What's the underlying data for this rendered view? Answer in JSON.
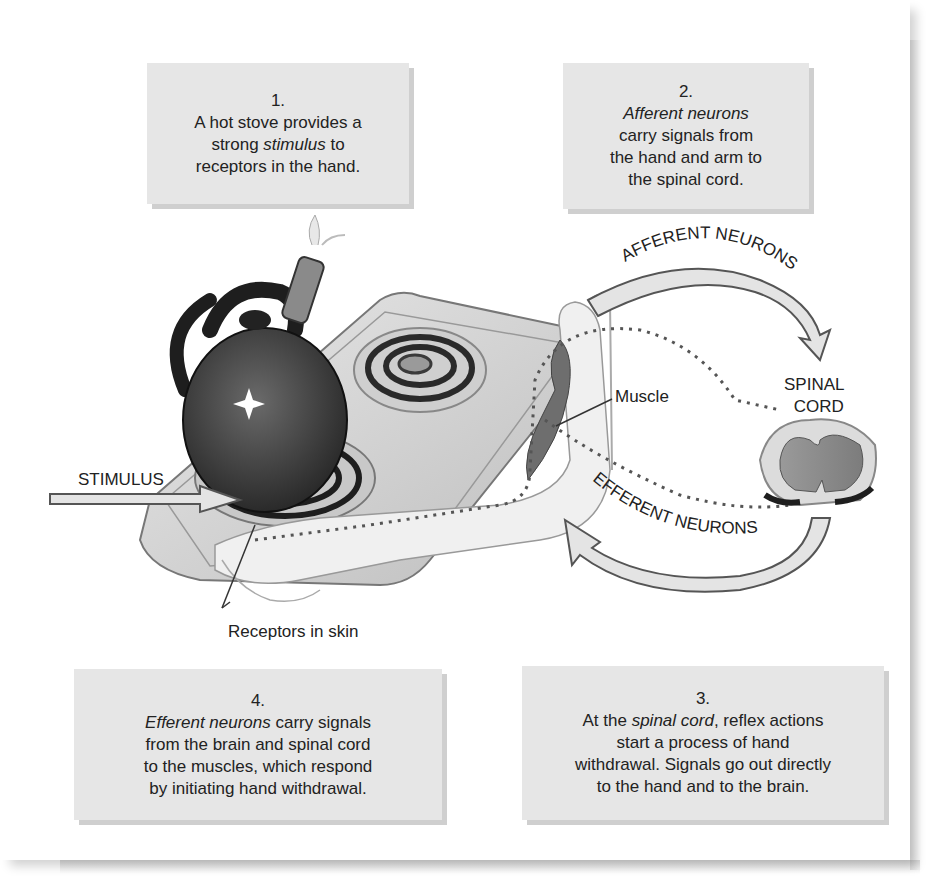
{
  "steps": [
    {
      "number": "1.",
      "pre": "A hot stove provides a strong ",
      "em": "stimulus",
      "post": " to receptors in the hand.",
      "lines": [
        "A hot stove provides a",
        "strong ",
        "stimulus",
        " to",
        "receptors in the hand."
      ]
    },
    {
      "number": "2.",
      "em": "Afferent neurons",
      "post": "carry signals from the hand and arm to the spinal cord.",
      "lines": [
        "Afferent neurons",
        "carry signals from",
        "the hand and arm to",
        "the spinal cord."
      ]
    },
    {
      "number": "3.",
      "pre": "At the ",
      "em": "spinal cord",
      "post": ", reflex actions start a process of hand withdrawal. Signals go out directly to the hand and to the brain.",
      "lines": [
        "At the ",
        "spinal cord",
        ", reflex actions",
        "start a process of hand",
        "withdrawal. Signals go out directly",
        "to the hand and to the brain."
      ]
    },
    {
      "number": "4.",
      "em": "Efferent neurons",
      "post": " carry signals from the brain and spinal cord to the muscles, which respond by initiating hand withdrawal.",
      "lines": [
        "Efferent neurons",
        " carry signals",
        "from the brain and spinal cord",
        "to the muscles, which respond",
        "by initiating hand withdrawal."
      ]
    }
  ],
  "labels": {
    "stimulus": "STIMULUS",
    "receptors": "Receptors in skin",
    "muscle": "Muscle",
    "spinal_cord_line1": "SPINAL",
    "spinal_cord_line2": "CORD",
    "afferent_arrow": "AFFERENT NEURONS",
    "efferent_arrow": "EFFERENT NEURONS"
  },
  "colors": {
    "box_fill": "#e6e6e6",
    "box_shadow": "#cfcfcf",
    "arrow_fill": "#e4e4e4",
    "text": "#222222"
  }
}
